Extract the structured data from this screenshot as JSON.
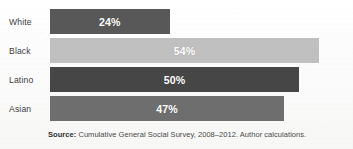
{
  "chart_data": {
    "type": "bar",
    "orientation": "horizontal",
    "title": "",
    "subtitle": "",
    "xlabel": "",
    "ylabel": "",
    "categories": [
      "White",
      "Black",
      "Latino",
      "Asian"
    ],
    "values": [
      24,
      54,
      50,
      47
    ],
    "value_labels": [
      "24%",
      "54%",
      "50%",
      "47%"
    ],
    "value_unit": "%",
    "xlim": [
      0,
      60
    ],
    "grid": false,
    "legend": null,
    "bar_colors": [
      "#585858",
      "#c0c0c0",
      "#464646",
      "#6e6e6e"
    ],
    "value_label_color": "#ffffff",
    "bars": [
      {
        "category": "White",
        "value": 24,
        "label": "24%",
        "color": "#585858"
      },
      {
        "category": "Black",
        "value": 54,
        "label": "54%",
        "color": "#c0c0c0"
      },
      {
        "category": "Latino",
        "value": 50,
        "label": "50%",
        "color": "#464646"
      },
      {
        "category": "Asian",
        "value": 47,
        "label": "47%",
        "color": "#6e6e6e"
      }
    ]
  },
  "source": {
    "prefix": "Source:",
    "text": " Cumulative General Social Survey, 2008–2012. Author calculations."
  },
  "colors": {
    "background": "#fbfbfb",
    "label_text": "#3c3c3c",
    "source_text": "#4a4a4a"
  }
}
